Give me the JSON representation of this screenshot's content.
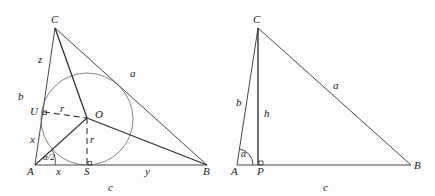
{
  "left_figure": {
    "vertices": {
      "A": [
        35,
        165
      ],
      "B": [
        207,
        165
      ],
      "C": [
        55,
        28
      ]
    },
    "incenter": {
      "O": [
        87,
        118
      ]
    },
    "inradius": 46,
    "tangent_points": {
      "U": [
        44,
        113
      ],
      "S": [
        87,
        165
      ]
    },
    "labels": [
      {
        "id": "C",
        "text": "C",
        "x": 51,
        "y": 14
      },
      {
        "id": "z",
        "text": "z",
        "x": 38,
        "y": 54
      },
      {
        "id": "a",
        "text": "a",
        "x": 130,
        "y": 68
      },
      {
        "id": "b",
        "text": "b",
        "x": 18,
        "y": 91
      },
      {
        "id": "U",
        "text": "U",
        "x": 30,
        "y": 106
      },
      {
        "id": "r1",
        "text": "r",
        "x": 60,
        "y": 103
      },
      {
        "id": "O",
        "text": "O",
        "x": 95,
        "y": 109
      },
      {
        "id": "x1",
        "text": "x",
        "x": 30,
        "y": 134
      },
      {
        "id": "r2",
        "text": "r",
        "x": 90,
        "y": 134
      },
      {
        "id": "alpha_half",
        "text": "α/2",
        "x": 43,
        "y": 153
      },
      {
        "id": "A",
        "text": "A",
        "x": 27,
        "y": 166
      },
      {
        "id": "x2",
        "text": "x",
        "x": 56,
        "y": 166
      },
      {
        "id": "S",
        "text": "S",
        "x": 84,
        "y": 166
      },
      {
        "id": "y",
        "text": "y",
        "x": 145,
        "y": 166
      },
      {
        "id": "B",
        "text": "B",
        "x": 203,
        "y": 166
      },
      {
        "id": "c",
        "text": "c",
        "x": 108,
        "y": 182
      }
    ]
  },
  "right_figure": {
    "vertices": {
      "A": [
        237,
        165
      ],
      "B": [
        411,
        165
      ],
      "C": [
        258,
        28
      ],
      "P": [
        258,
        165
      ]
    },
    "labels": [
      {
        "id": "C",
        "text": "C",
        "x": 253,
        "y": 14
      },
      {
        "id": "b",
        "text": "b",
        "x": 236,
        "y": 97
      },
      {
        "id": "h",
        "text": "h",
        "x": 264,
        "y": 108
      },
      {
        "id": "a",
        "text": "a",
        "x": 333,
        "y": 80
      },
      {
        "id": "alpha",
        "text": "α",
        "x": 241,
        "y": 149
      },
      {
        "id": "A",
        "text": "A",
        "x": 231,
        "y": 166
      },
      {
        "id": "P",
        "text": "P",
        "x": 257,
        "y": 166
      },
      {
        "id": "c",
        "text": "c",
        "x": 323,
        "y": 182
      },
      {
        "id": "B",
        "text": "B",
        "x": 414,
        "y": 160
      }
    ]
  },
  "colors": {
    "stroke": "#333333",
    "text": "#222222",
    "background": "#fdfdfd"
  }
}
